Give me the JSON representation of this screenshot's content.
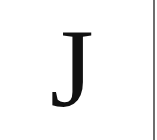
{
  "glyph": {
    "character": "J",
    "color": "#111111"
  },
  "edge": {
    "color": "#6e6e6e"
  }
}
